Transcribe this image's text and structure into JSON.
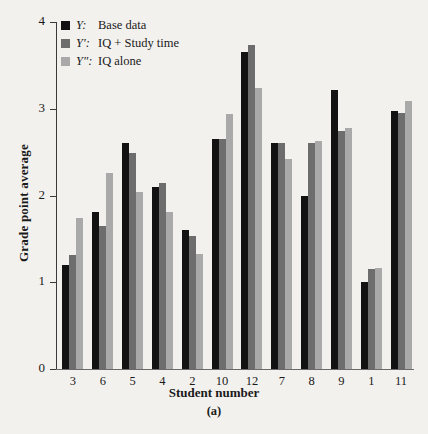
{
  "chart_data": {
    "type": "bar",
    "title": "",
    "xlabel": "Student number",
    "ylabel": "Grade point average",
    "panel_caption": "(a)",
    "categories": [
      "3",
      "6",
      "5",
      "4",
      "2",
      "10",
      "12",
      "7",
      "8",
      "9",
      "1",
      "11"
    ],
    "ylim": [
      0,
      4
    ],
    "yticks": [
      "0",
      "1",
      "2",
      "3",
      "4"
    ],
    "grid": false,
    "legend_position": "top-left",
    "series": [
      {
        "name": "Y: Base data",
        "symbol": "Y:",
        "label": "Base data",
        "color": "#121212",
        "values": [
          1.2,
          1.81,
          2.6,
          2.1,
          1.6,
          2.65,
          3.65,
          2.6,
          2.0,
          3.22,
          1.0,
          2.97
        ]
      },
      {
        "name": "Y': IQ + Study time",
        "symbol": "Y′:",
        "label": "IQ + Study time",
        "color": "#6d6d6d",
        "values": [
          1.31,
          1.65,
          2.49,
          2.14,
          1.53,
          2.65,
          3.73,
          2.6,
          2.61,
          2.74,
          1.15,
          2.95
        ]
      },
      {
        "name": "Y'': IQ alone",
        "symbol": "Y″:",
        "label": "IQ alone",
        "color": "#a9a9a9",
        "values": [
          1.74,
          2.26,
          2.04,
          1.81,
          1.33,
          2.94,
          3.24,
          2.42,
          2.63,
          2.78,
          1.16,
          3.09
        ]
      }
    ]
  }
}
